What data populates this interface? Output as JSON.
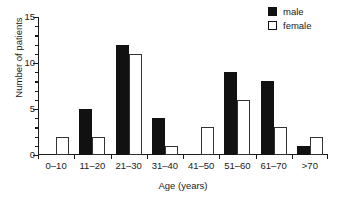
{
  "chart_data": {
    "type": "bar",
    "title": "",
    "subtitle": "",
    "xlabel": "Age (years)",
    "ylabel": "Number of patients",
    "categories": [
      "0–10",
      "11–20",
      "21–30",
      "31–40",
      "41–50",
      "51–60",
      "61–70",
      ">70"
    ],
    "series": [
      {
        "name": "male",
        "values": [
          0,
          5,
          12,
          4,
          0,
          9,
          8,
          1
        ],
        "color": "#111111",
        "fill": "solid"
      },
      {
        "name": "female",
        "values": [
          2,
          2,
          11,
          1,
          3,
          6,
          3,
          2
        ],
        "color": "#ffffff",
        "fill": "open"
      }
    ],
    "ylim": [
      0,
      15
    ],
    "ymajor_ticks": [
      0,
      5,
      10,
      15
    ],
    "ytick_labels": [
      "0",
      "5",
      "10",
      "15"
    ],
    "yminor_tick_step": 1,
    "grid": false,
    "legend_position": "top-right",
    "legend_entries": [
      "male",
      "female"
    ]
  },
  "legend": {
    "items": [
      {
        "label": "male",
        "swatch": "filled-square-icon"
      },
      {
        "label": "female",
        "swatch": "open-square-icon"
      }
    ]
  },
  "axes": {
    "x_title": "Age (years)",
    "y_title": "Number of patients"
  }
}
